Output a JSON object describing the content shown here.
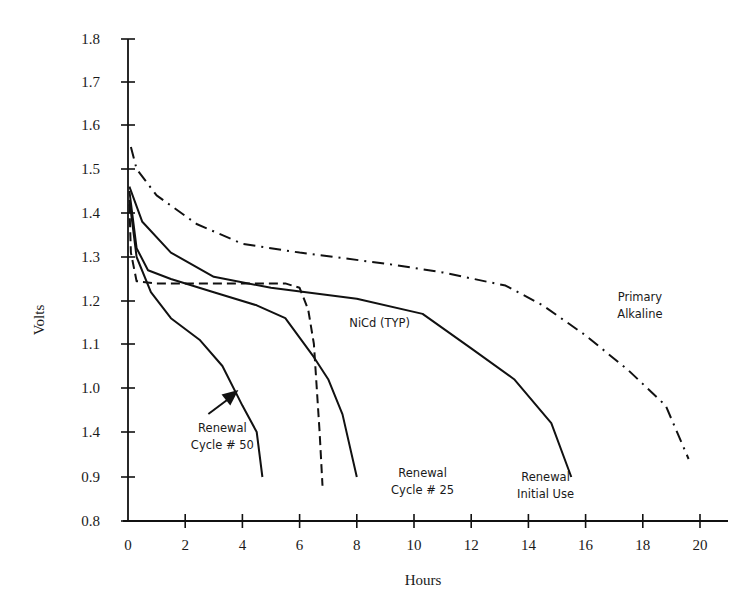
{
  "chart_data": {
    "type": "line",
    "title": "",
    "xlabel": "Hours",
    "ylabel": "Volts",
    "xlim": [
      0,
      20
    ],
    "ylim": [
      0.8,
      1.8
    ],
    "grid": false,
    "legend": "inline annotations",
    "x_ticks": [
      "0",
      "2",
      "4",
      "6",
      "8",
      "10",
      "12",
      "14",
      "16",
      "18",
      "20"
    ],
    "y_tick_labels": [
      "1.8",
      "1.7",
      "1.6",
      "1.5",
      "1.4",
      "1.3",
      "1.2",
      "1.1",
      "1.0",
      "1.4",
      "0.9",
      "0.8"
    ],
    "y_tick_values": [
      1.8,
      1.7,
      1.6,
      1.5,
      1.4,
      1.3,
      1.2,
      1.1,
      1.0,
      0.95,
      0.9,
      0.8
    ],
    "series": [
      {
        "name": "Renewal Initial Use",
        "style": "solid",
        "x": [
          0.05,
          0.5,
          1.5,
          3,
          5,
          8,
          10.3,
          12,
          13.5,
          14.8,
          15.5
        ],
        "y": [
          1.46,
          1.38,
          1.31,
          1.255,
          1.23,
          1.205,
          1.17,
          1.09,
          1.02,
          0.96,
          0.9
        ]
      },
      {
        "name": "Renewal Cycle # 25",
        "style": "solid",
        "x": [
          0.05,
          0.3,
          0.7,
          1.5,
          3,
          4.5,
          5.5,
          6.5,
          7,
          7.5,
          8
        ],
        "y": [
          1.45,
          1.32,
          1.27,
          1.25,
          1.22,
          1.19,
          1.16,
          1.07,
          1.02,
          0.97,
          0.9
        ]
      },
      {
        "name": "Renewal Cycle # 50",
        "style": "solid",
        "x": [
          0.05,
          0.3,
          0.8,
          1.5,
          2.5,
          3.3,
          4,
          4.5,
          4.7
        ],
        "y": [
          1.43,
          1.3,
          1.22,
          1.16,
          1.11,
          1.05,
          0.98,
          0.95,
          0.9
        ]
      },
      {
        "name": "NiCd (TYP)",
        "style": "dashed",
        "x": [
          0.05,
          0.1,
          0.3,
          1,
          5.5,
          6,
          6.3,
          6.5,
          6.7,
          6.8
        ],
        "y": [
          1.42,
          1.31,
          1.245,
          1.24,
          1.24,
          1.23,
          1.18,
          1.1,
          0.95,
          0.88
        ]
      },
      {
        "name": "Primary Alkaline",
        "style": "dashdot",
        "x": [
          0.1,
          0.3,
          1,
          2.4,
          4,
          6,
          9,
          11,
          13.2,
          14.5,
          16,
          17.5,
          18.8,
          19.6
        ],
        "y": [
          1.55,
          1.5,
          1.44,
          1.375,
          1.33,
          1.31,
          1.285,
          1.265,
          1.235,
          1.19,
          1.12,
          1.04,
          0.98,
          0.92
        ]
      }
    ],
    "annotations": [
      {
        "lines": [
          "Renewal",
          "Cycle # 50"
        ],
        "x": 3.3,
        "y": 0.95,
        "arrow_to": [
          4.0,
          1.0
        ]
      },
      {
        "lines": [
          "Renewal",
          "Cycle # 25"
        ],
        "x": 10.3,
        "y": 0.9
      },
      {
        "lines": [
          "Renewal",
          "Initial Use"
        ],
        "x": 14.6,
        "y": 0.89
      },
      {
        "lines": [
          "NiCd (TYP)"
        ],
        "x": 8.8,
        "y": 1.14
      },
      {
        "lines": [
          "Primary",
          "Alkaline"
        ],
        "x": 17.9,
        "y": 1.2
      }
    ]
  }
}
